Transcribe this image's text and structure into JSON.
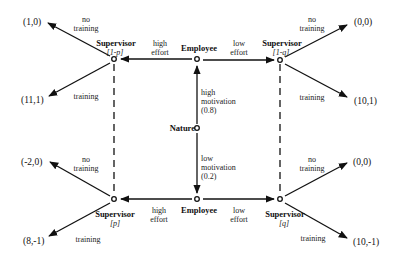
{
  "diagram": {
    "type": "game-tree",
    "nodes": {
      "nature": {
        "label": "Nature"
      },
      "employee_top": {
        "label": "Employee"
      },
      "employee_bottom": {
        "label": "Employee"
      },
      "supervisor_top_left": {
        "label": "Supervisor",
        "belief": "[1-p]"
      },
      "supervisor_top_right": {
        "label": "Supervisor",
        "belief": "[1-q]"
      },
      "supervisor_bottom_left": {
        "label": "Supervisor",
        "belief": "[p]"
      },
      "supervisor_bottom_right": {
        "label": "Supervisor",
        "belief": "[q]"
      }
    },
    "nature_moves": {
      "high": {
        "line1": "high",
        "line2": "motivation",
        "prob": "(0.8)"
      },
      "low": {
        "line1": "low",
        "line2": "motivation",
        "prob": "(0.2)"
      }
    },
    "employee_moves": {
      "top_high": {
        "line1": "high",
        "line2": "effort"
      },
      "top_low": {
        "line1": "low",
        "line2": "effort"
      },
      "bottom_high": {
        "line1": "high",
        "line2": "effort"
      },
      "bottom_low": {
        "line1": "low",
        "line2": "effort"
      }
    },
    "supervisor_moves": {
      "tl_no": {
        "line1": "no",
        "line2": "training"
      },
      "tl_yes": {
        "line1": "training"
      },
      "tr_no": {
        "line1": "no",
        "line2": "training"
      },
      "tr_yes": {
        "line1": "training"
      },
      "bl_no": {
        "line1": "no",
        "line2": "training"
      },
      "bl_yes": {
        "line1": "training"
      },
      "br_no": {
        "line1": "no",
        "line2": "training"
      },
      "br_yes": {
        "line1": "training"
      }
    },
    "payoffs": {
      "tl_no": "(1,0)",
      "tl_yes": "(11,1)",
      "tr_no": "(0,0)",
      "tr_yes": "(10,1)",
      "bl_no": "(-2,0)",
      "bl_yes": "(8,-1)",
      "br_no": "(0,0)",
      "br_yes": "(10,-1)"
    },
    "information_sets": [
      "left: [1-p] / [p]",
      "right: [1-q] / [q]"
    ]
  }
}
